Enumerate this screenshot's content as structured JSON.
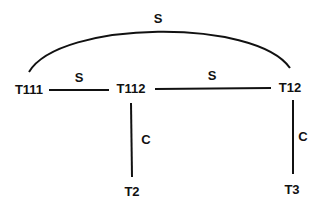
{
  "diagram": {
    "colors": {
      "line": "#111111",
      "text": "#111111",
      "background": "#ffffff"
    },
    "nodes": [
      {
        "id": "T111",
        "label": "T111",
        "x": 29,
        "y": 89
      },
      {
        "id": "T112",
        "label": "T112",
        "x": 131,
        "y": 88
      },
      {
        "id": "T12",
        "label": "T12",
        "x": 290,
        "y": 87
      },
      {
        "id": "T2",
        "label": "T2",
        "x": 132,
        "y": 191
      },
      {
        "id": "T3",
        "label": "T3",
        "x": 292,
        "y": 189
      }
    ],
    "edges": [
      {
        "from": "T111",
        "to": "T12",
        "label": "S",
        "shape": "arc"
      },
      {
        "from": "T111",
        "to": "T112",
        "label": "S",
        "shape": "line"
      },
      {
        "from": "T112",
        "to": "T12",
        "label": "S",
        "shape": "line"
      },
      {
        "from": "T112",
        "to": "T2",
        "label": "C",
        "shape": "line"
      },
      {
        "from": "T12",
        "to": "T3",
        "label": "C",
        "shape": "line"
      }
    ]
  }
}
